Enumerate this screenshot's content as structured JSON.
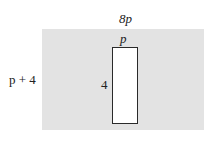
{
  "diagram": {
    "outer_rectangle": {
      "width_label": "8p",
      "height_label": "p + 4",
      "fill": "#e3e3e3"
    },
    "inner_rectangle": {
      "width_label": "p",
      "height_label": "4",
      "fill": "#ffffff",
      "stroke": "#2a2a2a"
    }
  }
}
